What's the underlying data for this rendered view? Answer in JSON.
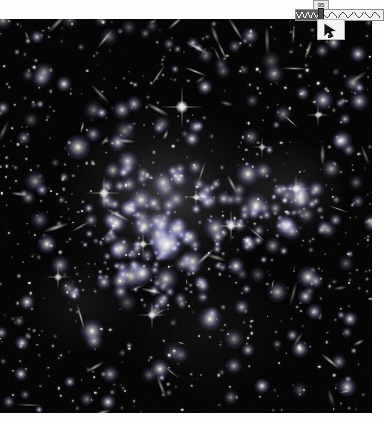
{
  "window": {
    "title": "Galaxy Cluster Viewer",
    "background_color": "#ffffff"
  },
  "image_plate": {
    "name": "deep-field-galaxy-cluster",
    "description": "Deep-field astronomical exposure of a massive galaxy cluster",
    "background_color": "#000000",
    "x": 0,
    "y": 19,
    "width": 372,
    "height": 394,
    "objects": [
      {
        "type": "cluster-core",
        "cx": 44,
        "cy": 45,
        "r": 150,
        "brightness": 0.42
      },
      {
        "type": "bright-star",
        "cx": 48.5,
        "cy": 23.5,
        "mag": 1.0
      },
      {
        "type": "bright-star",
        "cx": 28.0,
        "cy": 44.0,
        "mag": 0.9
      },
      {
        "type": "bright-star",
        "cx": 62.0,
        "cy": 63.0,
        "mag": 0.8
      }
    ]
  },
  "hud": {
    "name": "overlay-controls",
    "tooltip": {
      "label": "95",
      "background_color": "#e9e9e9",
      "text_color": "#141414"
    },
    "slider": {
      "name": "zigzag-range-slider",
      "value": 29,
      "min": 0,
      "max": 100,
      "filled_color": "#5d5d5d",
      "track_color": "#f2f2f2",
      "border_color": "#8e8e8e",
      "thumb_color": "#4a4a4a"
    },
    "cursor": {
      "name": "mouse-pointer",
      "color": "#1a1a1a",
      "background_color": "#f4f4f4"
    }
  }
}
